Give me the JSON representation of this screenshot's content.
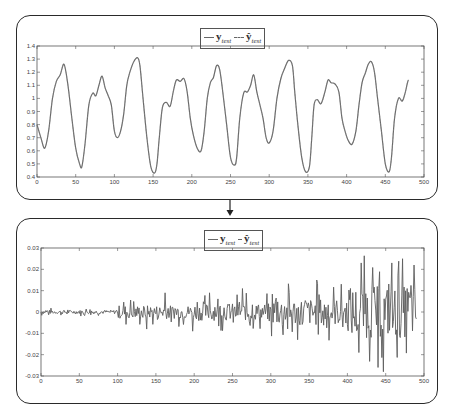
{
  "chart_data": [
    {
      "type": "line",
      "title": "",
      "legend": {
        "position": "top-center",
        "entries": [
          "y_test",
          "ŷ_test"
        ]
      },
      "xlabel": "",
      "ylabel": "",
      "xlim": [
        0,
        500
      ],
      "ylim": [
        0.4,
        1.4
      ],
      "xticks": [
        0,
        50,
        100,
        150,
        200,
        250,
        300,
        350,
        400,
        450,
        500
      ],
      "yticks": [
        0.4,
        0.5,
        0.6,
        0.7,
        0.8,
        0.9,
        1,
        1.1,
        1.2,
        1.3,
        1.4
      ],
      "ytick_labels": [
        "0.4",
        "0.5",
        "0.6",
        "0.7",
        "0.8",
        "0.9",
        "1",
        "1.1",
        "1.2",
        "1.3",
        "1.4"
      ],
      "grid": false,
      "series": [
        {
          "name": "y_test",
          "style": "solid",
          "x": [
            0,
            5,
            10,
            15,
            20,
            25,
            30,
            35,
            40,
            45,
            50,
            55,
            58,
            62,
            67,
            72,
            76,
            80,
            84,
            88,
            92,
            96,
            100,
            104,
            108,
            112,
            116,
            120,
            125,
            130,
            133,
            137,
            142,
            147,
            152,
            155,
            158,
            162,
            167,
            172,
            176,
            180,
            185,
            190,
            194,
            198,
            202,
            207,
            212,
            216,
            220,
            224,
            228,
            232,
            236,
            240,
            245,
            250,
            255,
            258,
            262,
            267,
            272,
            276,
            280,
            284,
            288,
            292,
            296,
            300,
            305,
            310,
            315,
            320,
            325,
            330,
            333,
            337,
            342,
            347,
            352,
            355,
            358,
            362,
            367,
            372,
            376,
            380,
            385,
            390,
            394,
            398,
            402,
            407,
            412,
            416,
            420,
            424,
            428,
            432,
            436,
            440,
            445,
            450,
            455,
            458,
            462,
            467,
            472,
            476,
            480,
            485,
            489
          ],
          "y": [
            0.8,
            0.7,
            0.62,
            0.75,
            1.0,
            1.13,
            1.18,
            1.26,
            1.1,
            0.85,
            0.62,
            0.5,
            0.48,
            0.65,
            0.95,
            1.04,
            1.02,
            1.1,
            1.17,
            1.08,
            1.02,
            0.95,
            0.75,
            0.7,
            0.75,
            0.88,
            1.1,
            1.2,
            1.28,
            1.31,
            1.25,
            1.0,
            0.7,
            0.48,
            0.43,
            0.5,
            0.7,
            0.93,
            0.97,
            0.94,
            1.05,
            1.14,
            1.13,
            1.15,
            1.05,
            0.85,
            0.72,
            0.62,
            0.6,
            0.75,
            1.0,
            1.12,
            1.16,
            1.25,
            1.22,
            1.05,
            0.8,
            0.55,
            0.49,
            0.55,
            0.85,
            1.04,
            1.05,
            1.1,
            1.18,
            1.05,
            0.95,
            0.85,
            0.7,
            0.66,
            0.75,
            1.0,
            1.15,
            1.23,
            1.29,
            1.25,
            1.05,
            0.8,
            0.55,
            0.44,
            0.48,
            0.7,
            0.95,
            0.99,
            0.96,
            1.05,
            1.14,
            1.12,
            1.11,
            1.05,
            0.85,
            0.75,
            0.68,
            0.65,
            0.75,
            0.95,
            1.12,
            1.19,
            1.26,
            1.28,
            1.2,
            1.0,
            0.75,
            0.5,
            0.44,
            0.55,
            0.85,
            1.0,
            0.98,
            1.05,
            1.14,
            1.1
          ]
        },
        {
          "name": "ŷ_test",
          "style": "dashed",
          "note": "overlaps y_test"
        }
      ]
    },
    {
      "type": "line",
      "title": "",
      "legend": {
        "position": "top-center",
        "entries": [
          "y_test",
          "ŷ_test"
        ]
      },
      "xlabel": "",
      "ylabel": "",
      "xlim": [
        0,
        500
      ],
      "ylim": [
        -0.03,
        0.03
      ],
      "xticks": [
        0,
        50,
        100,
        150,
        200,
        250,
        300,
        350,
        400,
        450,
        500
      ],
      "yticks": [
        -0.03,
        -0.02,
        -0.01,
        0,
        0.01,
        0.02,
        0.03
      ],
      "ytick_labels": [
        "-0.03",
        "-0.02",
        "-0.01",
        "0",
        "0.01",
        "0.02",
        "0.03"
      ],
      "grid": false,
      "series": [
        {
          "name": "y_test - ŷ_test (residual)",
          "style": "solid",
          "amplitude_envelope": [
            {
              "x": [
                0,
                100
              ],
              "amp": 0.002
            },
            {
              "x": [
                100,
                200
              ],
              "amp": 0.007
            },
            {
              "x": [
                200,
                300
              ],
              "amp": 0.009
            },
            {
              "x": [
                300,
                400
              ],
              "amp": 0.014
            },
            {
              "x": [
                400,
                490
              ],
              "amp": 0.027
            }
          ],
          "peaks": [
            {
              "x": 162,
              "y": 0.009
            },
            {
              "x": 138,
              "y": -0.008
            },
            {
              "x": 198,
              "y": -0.009
            },
            {
              "x": 220,
              "y": 0.009
            },
            {
              "x": 263,
              "y": 0.011
            },
            {
              "x": 335,
              "y": -0.013
            },
            {
              "x": 360,
              "y": 0.015
            },
            {
              "x": 418,
              "y": 0.023
            },
            {
              "x": 415,
              "y": -0.019
            },
            {
              "x": 440,
              "y": -0.026
            },
            {
              "x": 447,
              "y": -0.028
            },
            {
              "x": 458,
              "y": 0.023
            },
            {
              "x": 478,
              "y": 0.011
            }
          ]
        }
      ]
    }
  ],
  "legend": {
    "entry1": "y",
    "entry1_sub": "test",
    "entry2": "ŷ",
    "entry2_sub": "test"
  },
  "arrow_icon": "down-arrow-icon"
}
